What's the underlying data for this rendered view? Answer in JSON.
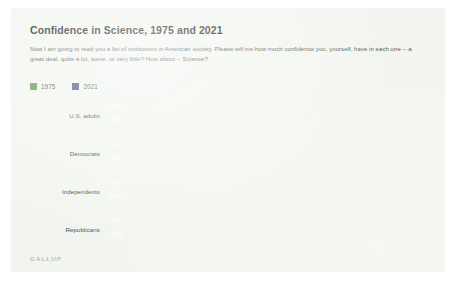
{
  "card": {
    "title": "Confidence in Science, 1975 and 2021",
    "subtitle": "Now I am going to read you a list of institutions in American society.  Please tell me how much confidence you, yourself, have in each one -- a great deal, quite a lot, some, or very little? How about -- Science?",
    "footer": "GALLUP"
  },
  "colors": {
    "series_1975": "#5d9e4b",
    "series_2021": "#474b7d",
    "card_background": "#f2f5ef",
    "title_text": "#1c1c1c",
    "body_text": "#4a5250",
    "footer_text": "#b4bcb8",
    "bar_value_text": "#ffffff"
  },
  "chart_data": {
    "type": "bar",
    "orientation": "horizontal",
    "title": "Confidence in Science, 1975 and 2021",
    "subtitle": "Now I am going to read you a list of institutions in American society.  Please tell me how much confidence you, yourself, have in each one -- a great deal, quite a lot, some, or very little? How about -- Science?",
    "xlabel": "",
    "ylabel": "",
    "xlim": [
      0,
      100
    ],
    "grid": false,
    "legend_position": "top-left",
    "value_suffix": "%",
    "categories": [
      "U.S. adults",
      "Democrats",
      "Independents",
      "Republicans"
    ],
    "series": [
      {
        "name": "1975",
        "color": "#5d9e4b",
        "values": [
          70,
          67,
          73,
          72
        ],
        "labels": [
          "70%",
          "67%",
          "73%",
          "72%"
        ]
      },
      {
        "name": "2021",
        "color": "#474b7d",
        "values": [
          64,
          79,
          65,
          45
        ],
        "labels": [
          "64%",
          "79%",
          "65%",
          "45%"
        ]
      }
    ],
    "legend": [
      {
        "label": "1975",
        "color": "#5d9e4b"
      },
      {
        "label": "2021",
        "color": "#474b7d"
      }
    ],
    "source": "GALLUP"
  }
}
